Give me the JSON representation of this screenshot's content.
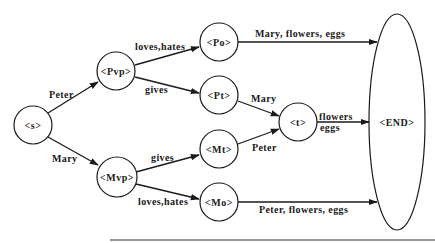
{
  "diagram": {
    "type": "finite-state-grammar",
    "nodes": {
      "s": "<s>",
      "pvp": "<Pvp>",
      "mvp": "<Mvp>",
      "po": "<Po>",
      "pt": "<Pt>",
      "mt": "<Mt>",
      "mo": "<Mo>",
      "t": "<t>",
      "end": "<END>"
    },
    "edges": {
      "s_pvp": "Peter",
      "s_mvp": "Mary",
      "pvp_po": "loves,hates",
      "pvp_pt": "gives",
      "mvp_mt": "gives",
      "mvp_mo": "loves,hates",
      "po_end": "Mary,  flowers,  eggs",
      "pt_t": "Mary",
      "mt_t": "Peter",
      "t_end_1": "flowers",
      "t_end_2": "eggs",
      "mo_end": "Peter,  flowers,  eggs"
    }
  }
}
